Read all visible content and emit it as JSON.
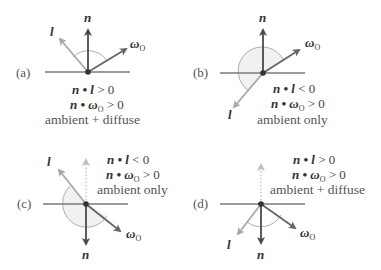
{
  "figure": {
    "colors": {
      "normal": "#4a4a4a",
      "light": "#a8a8a8",
      "view": "#666666",
      "surface": "#7a7a7a",
      "arc_fill": "#f1f1f1",
      "arc_stroke": "#9a9a9a",
      "dotted": "#b5b5b5"
    },
    "vector_labels": {
      "normal": "n",
      "light": "l",
      "view": "ω",
      "view_sub": "O"
    },
    "panels": [
      {
        "id": "a",
        "label": "(a)",
        "cond1_lhs": "n • l",
        "cond1_op": " > 0",
        "cond2_lhs": "n • ω",
        "cond2_sub": "O",
        "cond2_op": " > 0",
        "result": "ambient + diffuse"
      },
      {
        "id": "b",
        "label": "(b)",
        "cond1_lhs": "n • l",
        "cond1_op": " < 0",
        "cond2_lhs": "n • ω",
        "cond2_sub": "O",
        "cond2_op": " > 0",
        "result": "ambient only"
      },
      {
        "id": "c",
        "label": "(c)",
        "cond1_lhs": "n • l",
        "cond1_op": " < 0",
        "cond2_lhs": "n • ω",
        "cond2_sub": "O",
        "cond2_op": " > 0",
        "result": "ambient only"
      },
      {
        "id": "d",
        "label": "(d)",
        "cond1_lhs": "n • l",
        "cond1_op": " > 0",
        "cond2_lhs": "n • ω",
        "cond2_sub": "O",
        "cond2_op": " > 0",
        "result": "ambient + diffuse"
      }
    ]
  }
}
